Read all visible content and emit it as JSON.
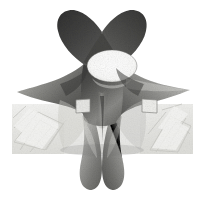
{
  "image": {
    "title": "Grayscale rendered mathematical surface sculpture",
    "subject_name": "genus-two minimal surface model",
    "width_px": 204,
    "height_px": 205,
    "page_background_color": "#ffffff",
    "render_style": "monochrome halftone / dithered grayscale raster",
    "alt_text": "A symmetric grayscale sculpture of a mathematical surface with a central elliptical hole, two upward horns, two lateral wings and two rounded lower lobes, set against a light crumpled textured backdrop panel."
  },
  "palette": {
    "white": "#ffffff",
    "highlight": "#f2f2f0",
    "light_gray": "#d2d2ce",
    "mid_gray": "#9a9a96",
    "dark_gray": "#5e5e5c",
    "darker_gray": "#3f3f3e",
    "deep_shadow": "#2b2b2a",
    "backdrop_panel": "#ececea",
    "backdrop_texture_line": "#cfcfcb",
    "outline": "#4a4a48"
  },
  "backdrop": {
    "name": "crumpled paper backdrop panel",
    "x": 12,
    "y": 104,
    "width": 181,
    "height": 50,
    "fill_color": "#ececea",
    "texture": "diagonal creased folds",
    "visible": true
  },
  "surface": {
    "name": "four-armed holed surface",
    "center_x": 102,
    "center_y": 100,
    "symmetry": "bilateral vertical mirror",
    "parts": [
      {
        "id": "upper-left-horn",
        "label": "Upper left horn arm",
        "tone": "#4a4a48",
        "tip_x": 66,
        "tip_y": 12
      },
      {
        "id": "upper-right-horn",
        "label": "Upper right horn arm",
        "tone": "#555553",
        "tip_x": 141,
        "tip_y": 12
      },
      {
        "id": "left-wing",
        "label": "Left lateral wing arm",
        "tone": "#77777a",
        "tip_x": 17,
        "tip_y": 92
      },
      {
        "id": "right-wing",
        "label": "Right lateral wing arm",
        "tone": "#9d9d9a",
        "tip_x": 190,
        "tip_y": 90
      },
      {
        "id": "lower-left-lobe",
        "label": "Lower left rounded lobe",
        "tone": "#8e8e8b",
        "tip_x": 81,
        "tip_y": 190
      },
      {
        "id": "lower-right-lobe",
        "label": "Lower right rounded lobe",
        "tone": "#7c7c79",
        "tip_x": 126,
        "tip_y": 190
      }
    ],
    "central_hole": {
      "label": "central elliptical aperture",
      "center_x": 112,
      "center_y": 66,
      "radius_x": 25,
      "radius_y": 16,
      "fill_color": "#fdfdfc"
    },
    "tabs": [
      {
        "id": "left-tab",
        "label": "Left bright tab facet",
        "x": 76,
        "y": 100,
        "width": 14,
        "height": 13,
        "fill_color": "#e8e8e5"
      },
      {
        "id": "right-tab",
        "label": "Right bright tab facet",
        "x": 142,
        "y": 99,
        "width": 15,
        "height": 14,
        "fill_color": "#efefec"
      }
    ],
    "highlight_bands": [
      {
        "id": "left-diagonal-highlight",
        "label": "Left diagonal specular band",
        "tone": "#dcdcd8"
      },
      {
        "id": "right-diagonal-highlight",
        "label": "Right diagonal specular band",
        "tone": "#d6d6d2"
      },
      {
        "id": "central-ridge-highlight",
        "label": "Central vertical ridge highlight",
        "tone": "#c6c6c2"
      }
    ]
  },
  "bounds": {
    "figure_left": 16,
    "figure_right": 191,
    "figure_top": 10,
    "figure_bottom": 191
  }
}
